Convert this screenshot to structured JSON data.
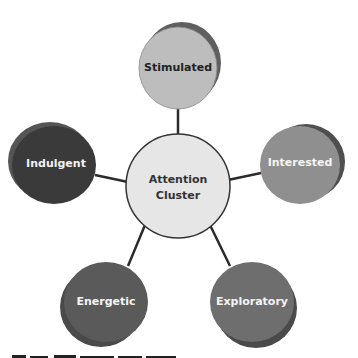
{
  "diagram": {
    "center": {
      "label_line1": "Attention",
      "label_line2": "Cluster",
      "fill": "#e6e6e6",
      "text_color": "#333333"
    },
    "nodes": [
      {
        "id": "stimulated",
        "label": "Stimulated",
        "fill": "#bdbdbd",
        "shadow": "#5f5f5f",
        "text_color": "#222222"
      },
      {
        "id": "indulgent",
        "label": "Indulgent",
        "fill": "#3a3a3a",
        "shadow": "#555555",
        "text_color": "#f2f2f2"
      },
      {
        "id": "interested",
        "label": "Interested",
        "fill": "#8f8f8f",
        "shadow": "#4f4f4f",
        "text_color": "#f4f4f4"
      },
      {
        "id": "energetic",
        "label": "Energetic",
        "fill": "#5a5a5a",
        "shadow": "#4a4a4a",
        "text_color": "#f4f4f4"
      },
      {
        "id": "exploratory",
        "label": "Exploratory",
        "fill": "#6e6e6e",
        "shadow": "#4a4a4a",
        "text_color": "#f4f4f4"
      }
    ]
  }
}
